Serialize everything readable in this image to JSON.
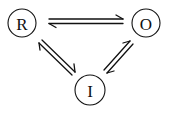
{
  "diagram": {
    "type": "reaction-scheme",
    "nodes": [
      {
        "id": "R",
        "label": "R",
        "cx": 22,
        "cy": 23,
        "r": 14
      },
      {
        "id": "O",
        "label": "O",
        "cx": 146,
        "cy": 23,
        "r": 14
      },
      {
        "id": "I",
        "label": "I",
        "cx": 90,
        "cy": 90,
        "r": 15
      }
    ],
    "edges": [
      {
        "from": "R",
        "to": "O",
        "style": "reversible-harpoons"
      },
      {
        "from": "R",
        "to": "I",
        "style": "reversible-harpoons"
      },
      {
        "from": "O",
        "to": "I",
        "style": "reversible-harpoons"
      }
    ],
    "colors": {
      "stroke": "#111111",
      "background": "#ffffff"
    }
  }
}
